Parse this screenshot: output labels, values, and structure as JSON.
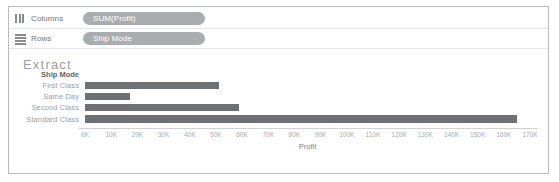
{
  "shelves": [
    {
      "label": "Columns",
      "icon": "columns-icon",
      "pill": "SUM(Profit)"
    },
    {
      "label": "Rows",
      "icon": "rows-icon",
      "pill": "Ship Mode"
    }
  ],
  "worksheet": {
    "title": "Extract",
    "row_header_title": "Ship Mode"
  },
  "chart_data": {
    "type": "bar",
    "orientation": "horizontal",
    "title": "Extract",
    "xlabel": "Profit",
    "ylabel": "Ship Mode",
    "categories": [
      "First Class",
      "Same Day",
      "Second Class",
      "Standard Class"
    ],
    "values": [
      51000,
      17000,
      59000,
      165000
    ],
    "xlim": [
      0,
      170000
    ],
    "xticks": [
      0,
      10000,
      20000,
      30000,
      40000,
      50000,
      60000,
      70000,
      80000,
      90000,
      100000,
      110000,
      120000,
      130000,
      140000,
      150000,
      160000,
      170000
    ],
    "xticklabels": [
      "0K",
      "10K",
      "20K",
      "30K",
      "40K",
      "50K",
      "60K",
      "70K",
      "80K",
      "90K",
      "100K",
      "110K",
      "120K",
      "130K",
      "140K",
      "150K",
      "160K",
      "170K"
    ],
    "grid": false,
    "legend": "none",
    "bar_color": "#6e7174"
  },
  "colors": {
    "bar": "#6e7174",
    "pill": "#a9adb0",
    "frame_border": "#b9bcbe",
    "title_text": "#9a9ea1"
  }
}
